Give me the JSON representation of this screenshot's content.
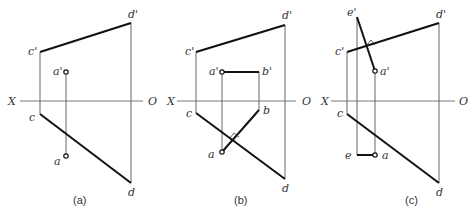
{
  "figure": {
    "panels": [
      {
        "id": "a",
        "caption": "(a)",
        "axis": {
          "left": "X",
          "right": "O"
        },
        "labels": {
          "c_prime": "c'",
          "d_prime": "d'",
          "a_prime": "a'",
          "c": "c",
          "d": "d",
          "a": "a"
        }
      },
      {
        "id": "b",
        "caption": "(b)",
        "axis": {
          "left": "X",
          "right": "O"
        },
        "labels": {
          "c_prime": "c'",
          "d_prime": "d'",
          "a_prime": "a'",
          "b_prime": "b'",
          "c": "c",
          "d": "d",
          "a": "a",
          "b": "b"
        }
      },
      {
        "id": "c",
        "caption": "(c)",
        "axis": {
          "left": "X",
          "right": "O"
        },
        "labels": {
          "e_prime": "e'",
          "c_prime": "c'",
          "d_prime": "d'",
          "a_prime": "a'",
          "c": "c",
          "d": "d",
          "e": "e",
          "a": "a"
        }
      }
    ]
  }
}
